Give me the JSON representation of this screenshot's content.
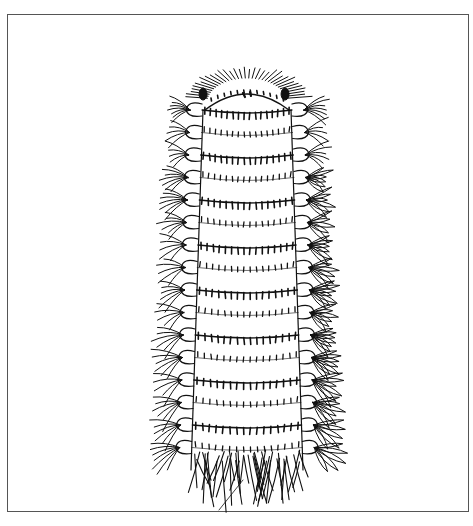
{
  "illustration": {
    "subject": "polychaete worm pen-and-ink drawing",
    "ink_color": "#111111",
    "frame_color": "#555555",
    "background": "#ffffff",
    "frame": {
      "x": 7,
      "y": 14,
      "width": 462,
      "height": 498
    },
    "body": {
      "head_top_y": 80,
      "tail_y": 470,
      "segments": 16,
      "top_half_width": 44,
      "bottom_half_width": 56,
      "center_x": 247
    }
  }
}
